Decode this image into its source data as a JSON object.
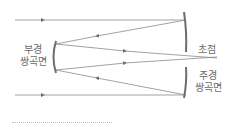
{
  "diagram": {
    "type": "cassegrain-telescope-optics",
    "labels": {
      "secondary_mirror": [
        "부경",
        "쌍곡면"
      ],
      "focus": "초점",
      "primary_mirror": [
        "주경",
        "쌍곡면"
      ]
    },
    "colors": {
      "line": "#7a7a7a",
      "mirror": "#6e6e6e",
      "text": "#6b6b6b"
    }
  }
}
